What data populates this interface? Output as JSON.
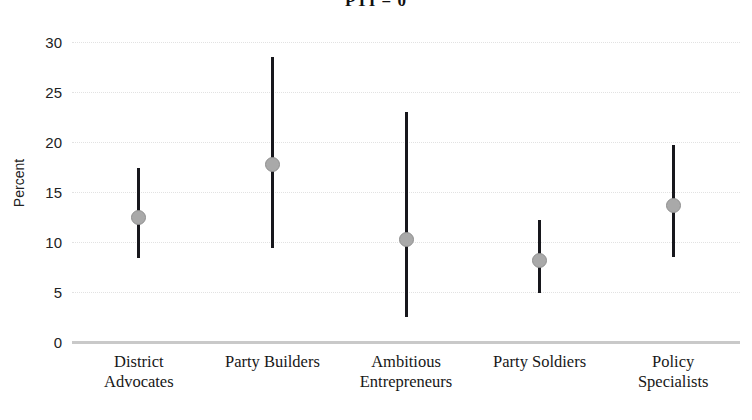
{
  "chart_data": {
    "type": "scatter",
    "title": "PTI = 0",
    "xlabel": "",
    "ylabel": "Percent",
    "ylim": [
      0,
      30
    ],
    "yticks": [
      0,
      5,
      10,
      15,
      20,
      25,
      30
    ],
    "ytick_labels": [
      "0",
      "5",
      "10",
      "15",
      "20",
      "25",
      "30"
    ],
    "grid": true,
    "legend": "none",
    "categories": [
      "District Advocates",
      "Party Builders",
      "Ambitious Entrepreneurs",
      "Party Soldiers",
      "Policy Specialists"
    ],
    "category_lines": [
      [
        "District",
        "Advocates"
      ],
      [
        "Party Builders",
        ""
      ],
      [
        "Ambitious",
        "Entrepreneurs"
      ],
      [
        "Party Soldiers",
        ""
      ],
      [
        "Policy",
        "Specialists"
      ]
    ],
    "values": [
      12.5,
      17.8,
      10.3,
      8.2,
      13.7
    ],
    "ci_low": [
      8.4,
      9.4,
      2.5,
      4.9,
      8.5
    ],
    "ci_high": [
      17.4,
      28.5,
      23.0,
      12.2,
      19.7
    ],
    "point_color": "#a9a9a9",
    "errorbar_color": "#17171c",
    "gridline_color": "#e2e2e2",
    "baseline_color": "#c9c9c9"
  }
}
